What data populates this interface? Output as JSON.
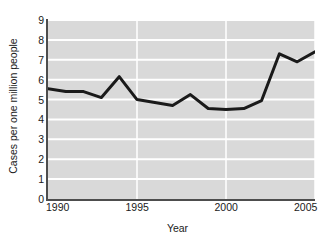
{
  "chart_data": {
    "type": "line",
    "title": "",
    "xlabel": "Year",
    "ylabel": "Cases per one million people",
    "x": [
      1990,
      1991,
      1992,
      1993,
      1994,
      1995,
      1996,
      1997,
      1998,
      1999,
      2000,
      2001,
      2002,
      2003,
      2004,
      2005
    ],
    "values": [
      5.55,
      5.4,
      5.4,
      5.1,
      6.15,
      5.0,
      4.85,
      4.7,
      5.25,
      4.55,
      4.5,
      4.55,
      4.95,
      7.3,
      6.9,
      7.4
    ],
    "series": [
      {
        "name": "Cases per one million people",
        "values": [
          5.55,
          5.4,
          5.4,
          5.1,
          6.15,
          5.0,
          4.85,
          4.7,
          5.25,
          4.55,
          4.5,
          4.55,
          4.95,
          7.3,
          6.9,
          7.4
        ]
      }
    ],
    "xlim": [
      1990,
      2005
    ],
    "ylim": [
      0,
      9
    ],
    "xticks": [
      1990,
      1995,
      2000,
      2005
    ],
    "xtick_labels": [
      "1990",
      "1995",
      "2000",
      "2005"
    ],
    "yticks": [
      0,
      1,
      2,
      3,
      4,
      5,
      6,
      7,
      8,
      9
    ],
    "ytick_labels": [
      "0",
      "1",
      "2",
      "3",
      "4",
      "5",
      "6",
      "7",
      "8",
      "9"
    ],
    "grid": true,
    "grid_axis": "y",
    "grid_color": "#ffffff",
    "plot_background": "#d9d9d9",
    "figure_background": "#ffffff",
    "line_color": "#1a1a1a",
    "line_width": 3,
    "legend": null,
    "legend_position": "none",
    "markers": false,
    "annotations": []
  }
}
